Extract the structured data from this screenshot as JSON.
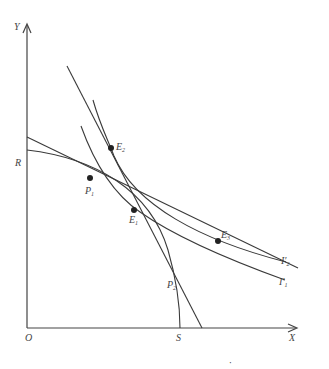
{
  "figure": {
    "axes": {
      "x_label": "X",
      "y_label": "Y",
      "origin_label": "O"
    },
    "curves": [
      {
        "id": "ppf",
        "label_start": "R",
        "label_end": "S",
        "description": "production possibility frontier"
      },
      {
        "id": "indifference-1",
        "label": "I′",
        "label_sub": "1"
      },
      {
        "id": "indifference-2",
        "label": "I′",
        "label_sub": "2"
      },
      {
        "id": "indifference-upper",
        "label": ""
      }
    ],
    "lines": [
      {
        "id": "price-line-shallow",
        "description": "tangent at P1 / E1 / E3"
      },
      {
        "id": "price-line-steep",
        "description": "tangent at P2 / E2"
      }
    ],
    "points": [
      {
        "id": "P1",
        "label": "P",
        "sub": "1"
      },
      {
        "id": "P2",
        "label": "P",
        "sub": "2"
      },
      {
        "id": "E1",
        "label": "E",
        "sub": "1"
      },
      {
        "id": "E2",
        "label": "E",
        "sub": "2"
      },
      {
        "id": "E3",
        "label": "E",
        "sub": "3"
      }
    ],
    "footer_mark": "·"
  }
}
